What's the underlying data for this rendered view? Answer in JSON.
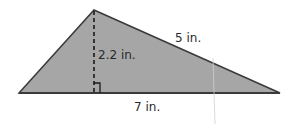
{
  "figure": {
    "type": "triangle-area-diagram",
    "shape": "triangle",
    "colors": {
      "fill": "#a6a6a6",
      "stroke": "#3a3a3a",
      "background": "#ffffff"
    },
    "vertices": {
      "left": [
        19,
        93
      ],
      "apex": [
        94,
        10
      ],
      "right": [
        280,
        93
      ]
    },
    "labels": {
      "base": "7 in.",
      "height": "2.2 in.",
      "side": "5 in."
    },
    "annotations": {
      "height_line": "dashed",
      "right_angle_marker": true
    }
  }
}
